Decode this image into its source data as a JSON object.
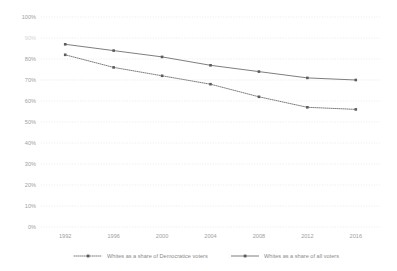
{
  "chart_data": {
    "type": "line",
    "title": "",
    "subtitle": "",
    "xlabel": "",
    "ylabel": "",
    "categories": [
      "1992",
      "1996",
      "2000",
      "2004",
      "2008",
      "2012",
      "2016"
    ],
    "x": [
      1992,
      1996,
      2000,
      2004,
      2008,
      2012,
      2016
    ],
    "ylim": [
      0,
      100
    ],
    "yticks": [
      0,
      10,
      20,
      30,
      40,
      50,
      60,
      70,
      80,
      90,
      100
    ],
    "ytick_labels": [
      "0%",
      "10%",
      "20%",
      "30%",
      "40%",
      "50%",
      "60%",
      "70%",
      "80%",
      "90%",
      "100%"
    ],
    "grid": true,
    "grid_style": "dotted-horizontal",
    "legend_position": "bottom",
    "series": [
      {
        "name": "Whites as a share of Democratice voters",
        "style": "dotted",
        "marker": "square",
        "color": "#6f6f6f",
        "values": [
          82,
          76,
          72,
          68,
          62,
          57,
          56
        ]
      },
      {
        "name": "Whites as a share of all voters",
        "style": "solid",
        "marker": "square",
        "color": "#6f6f6f",
        "values": [
          87,
          84,
          81,
          77,
          74,
          71,
          70
        ]
      }
    ]
  },
  "legend": {
    "entries": [
      {
        "label": "Whites as a share of Democratice voters"
      },
      {
        "label": "Whites as a share of all voters"
      }
    ]
  },
  "axes": {
    "y": {
      "labels": [
        "100%",
        "90%",
        "80%",
        "70%",
        "60%",
        "50%",
        "40%",
        "30%",
        "20%",
        "10%",
        "0%"
      ]
    },
    "x": {
      "labels": [
        "1992",
        "1996",
        "2000",
        "2004",
        "2008",
        "2012",
        "2016"
      ]
    }
  }
}
